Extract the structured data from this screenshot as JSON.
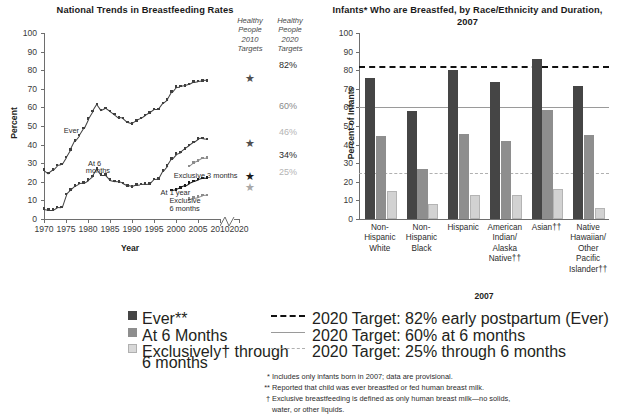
{
  "chart_data": [
    {
      "type": "line",
      "title": "National Trends in Breastfeeding Rates",
      "xlabel": "Year",
      "ylabel": "Percent",
      "ylim": [
        0,
        100
      ],
      "xlim": [
        1970,
        2010
      ],
      "yticks": [
        0,
        10,
        20,
        30,
        40,
        50,
        60,
        70,
        80,
        90,
        100
      ],
      "xticks": [
        1970,
        1975,
        1980,
        1985,
        1990,
        1995,
        2000,
        2005,
        2010,
        2020
      ],
      "axis_break_note": "break between 2010 and 2020",
      "grid": false,
      "legend_position": "inline-annotations",
      "series": [
        {
          "name": "Ever",
          "tone": "dark",
          "x": [
            1970,
            1971,
            1972,
            1973,
            1974,
            1975,
            1976,
            1977,
            1978,
            1979,
            1980,
            1981,
            1982,
            1983,
            1984,
            1985,
            1986,
            1987,
            1988,
            1989,
            1990,
            1991,
            1992,
            1993,
            1994,
            1995,
            1996,
            1997,
            1998,
            1999,
            2000,
            2001,
            2002,
            2003,
            2004,
            2005,
            2006,
            2007
          ],
          "values": [
            26.5,
            24.7,
            26.5,
            29.0,
            29.5,
            33.4,
            37.4,
            42.1,
            45.1,
            49.0,
            54.0,
            58.0,
            61.9,
            58.5,
            59.7,
            58.1,
            56.4,
            54.6,
            54.3,
            52.2,
            51.5,
            53.1,
            54.2,
            55.9,
            57.4,
            59.2,
            59.2,
            62.4,
            64.3,
            68.4,
            71.2,
            71.4,
            71.8,
            72.5,
            73.8,
            74.2,
            74.5,
            74.6
          ]
        },
        {
          "name": "At 6 months",
          "tone": "dark",
          "x": [
            1970,
            1971,
            1972,
            1973,
            1974,
            1975,
            1976,
            1977,
            1978,
            1979,
            1980,
            1981,
            1982,
            1983,
            1984,
            1985,
            1986,
            1987,
            1988,
            1989,
            1990,
            1991,
            1992,
            1993,
            1994,
            1995,
            1996,
            1997,
            1998,
            1999,
            2000,
            2001,
            2002,
            2003,
            2004,
            2005,
            2006,
            2007
          ],
          "values": [
            5.5,
            5.0,
            5.0,
            6.5,
            6.4,
            13.4,
            15.8,
            18.0,
            19.4,
            19.6,
            21.1,
            23.1,
            27.1,
            23.8,
            23.8,
            21.1,
            20.5,
            20.3,
            19.3,
            18.1,
            17.6,
            18.5,
            18.8,
            19.0,
            19.1,
            21.6,
            21.7,
            26.0,
            28.8,
            32.5,
            35.2,
            36.0,
            38.0,
            39.7,
            41.5,
            43.3,
            43.5,
            43.0
          ]
        },
        {
          "name": "At 1 year",
          "tone": "black",
          "x": [
            1999,
            2000,
            2001,
            2002,
            2003,
            2004,
            2005,
            2006,
            2007
          ],
          "values": [
            15.5,
            16.0,
            17.0,
            18.0,
            19.5,
            20.5,
            21.4,
            22.0,
            22.2
          ]
        },
        {
          "name": "Exclusive 3 months",
          "tone": "light",
          "x": [
            2003,
            2004,
            2005,
            2006,
            2007
          ],
          "values": [
            28.5,
            30.5,
            31.5,
            32.8,
            33.0
          ]
        },
        {
          "name": "Exclusive 6 months",
          "tone": "light",
          "x": [
            2003,
            2004,
            2005,
            2006,
            2007
          ],
          "values": [
            11.0,
            11.5,
            12.0,
            12.8,
            13.0
          ]
        }
      ],
      "target_columns": [
        {
          "header_lines": [
            "Healthy",
            "People",
            "2010",
            "Targets"
          ],
          "key": "hp2010",
          "markers": [
            {
              "label": "",
              "value": 75,
              "tone": "dark"
            },
            {
              "label": "",
              "value": 40,
              "tone": "dark"
            },
            {
              "label": "",
              "value": 22,
              "tone": "black"
            },
            {
              "label": "",
              "value": 16,
              "tone": "light"
            }
          ]
        },
        {
          "header_lines": [
            "Healthy",
            "People",
            "2020",
            "Targets"
          ],
          "key": "hp2020",
          "percent_labels": [
            {
              "text": "82%",
              "value": 82,
              "tone": "dark"
            },
            {
              "text": "60%",
              "value": 60,
              "tone": "medium"
            },
            {
              "text": "46%",
              "value": 46,
              "tone": "light"
            },
            {
              "text": "34%",
              "value": 34,
              "tone": "dark"
            },
            {
              "text": "25%",
              "value": 25,
              "tone": "light"
            }
          ]
        }
      ],
      "annotations": [
        {
          "text": "Ever",
          "x": 1974.5,
          "y": 47
        },
        {
          "text": "At 6",
          "x": 1980,
          "y": 29
        },
        {
          "text": "months",
          "x": 1979.5,
          "y": 25.5
        },
        {
          "text": "At 1 year",
          "x": 1996.5,
          "y": 13.5
        },
        {
          "text": "Exclusive 3 months",
          "x": 1999.5,
          "y": 22.5
        },
        {
          "text": "Exclusive",
          "x": 1998.5,
          "y": 9
        },
        {
          "text": "6 months",
          "x": 1998.5,
          "y": 5
        }
      ]
    },
    {
      "type": "bar",
      "title": "Infants* Who are Breastfed, by Race/Ethnicity and Duration, 2007",
      "xlabel": "2007",
      "ylabel": "Percent of Infants",
      "ylim": [
        0,
        100
      ],
      "yticks": [
        0,
        10,
        20,
        30,
        40,
        50,
        60,
        70,
        80,
        90,
        100
      ],
      "grid": false,
      "legend_position": "below",
      "categories": [
        [
          "Non-",
          "Hispanic",
          "White"
        ],
        [
          "Non-",
          "Hispanic",
          "Black"
        ],
        [
          "Hispanic"
        ],
        [
          "American",
          "Indian/",
          "Alaska",
          "Native††"
        ],
        [
          "Asian††"
        ],
        [
          "Native",
          "Hawaiian/",
          "Other",
          "Pacific",
          "Islander††"
        ]
      ],
      "series": [
        {
          "name": "Ever**",
          "values": [
            76,
            58,
            80,
            73.5,
            86,
            71.5
          ]
        },
        {
          "name": "At 6 Months",
          "values": [
            44.5,
            27,
            45.5,
            42,
            58.5,
            45
          ]
        },
        {
          "name": "Exclusively† through 6 months",
          "values": [
            15,
            8,
            13,
            12.8,
            16.3,
            6
          ]
        }
      ],
      "target_lines": [
        {
          "label": "2020 Target: 82% early postpartum (Ever)",
          "value": 82,
          "style": "dashed-bold"
        },
        {
          "label": "2020 Target: 60% at 6 months",
          "value": 60,
          "style": "solid"
        },
        {
          "label": "2020 Target: 25% through 6 months",
          "value": 25,
          "style": "dashed-light"
        }
      ]
    }
  ],
  "legend": {
    "swatches": [
      {
        "label": "Ever**",
        "key": "ever"
      },
      {
        "label": "At 6 Months",
        "key": "six"
      },
      {
        "label": "Exclusively† through",
        "label2": "6 months",
        "key": "exc"
      }
    ],
    "lines": [
      {
        "label": "2020 Target: 82% early postpartum (Ever)",
        "style": "dashed-bold"
      },
      {
        "label": "2020 Target: 60% at 6 months",
        "style": "solid"
      },
      {
        "label": "2020 Target: 25% through 6 months",
        "style": "dashed-light"
      }
    ]
  },
  "footnotes": [
    {
      "mark": "*",
      "text": "Includes only infants born in 2007; data are provisional."
    },
    {
      "mark": "**",
      "text": "Reported that child was ever breastfed or fed human breast milk."
    },
    {
      "mark": "†",
      "text": "Exclusive breastfeeding is defined as only human breast milk—no solids,"
    },
    {
      "mark": "",
      "text": "water, or other liquids."
    }
  ],
  "colors": {
    "ever": "#454545",
    "six_months": "#8e8e8e",
    "exclusive": "#d2d2d2",
    "target_dark": "#111111",
    "target_medium": "#9a9a9a",
    "target_light": "#b0b0b0",
    "text": "#231f20"
  }
}
